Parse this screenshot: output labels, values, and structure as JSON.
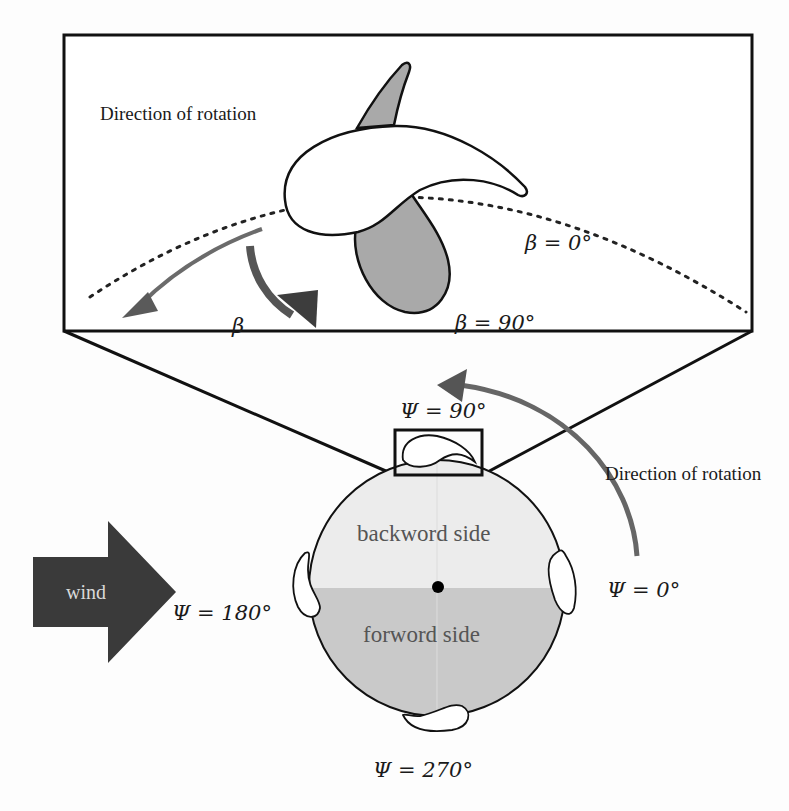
{
  "figure": {
    "zoom_panel": {
      "rotation_label": "Direction of rotation",
      "beta_symbol": "β",
      "beta_0_label": "β = 0°",
      "beta_90_label": "β = 90°"
    },
    "rotor": {
      "psi_90_label": "Ψ = 90°",
      "psi_0_label": "Ψ = 0°",
      "psi_180_label": "Ψ = 180°",
      "psi_270_label": "Ψ = 270°",
      "rotation_label": "Direction of rotation",
      "backward_label": "backword side",
      "forward_label": "forword side"
    },
    "wind": {
      "label": "wind"
    },
    "colors": {
      "line": "#111111",
      "blade_fill": "#a9a9a9",
      "arrow_gray": "#6b6b6b",
      "arrow_dark": "#3d3d3d",
      "backward_fill": "#ececec",
      "forward_fill": "#c9c9c9",
      "wind_fill": "#3a3a3a"
    }
  }
}
